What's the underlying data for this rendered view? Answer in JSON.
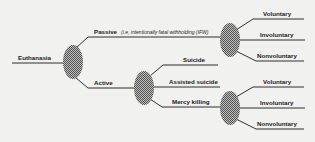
{
  "diagram": {
    "type": "tree",
    "root": {
      "label": "Euthanasia"
    },
    "branches": {
      "passive": {
        "label": "Passive",
        "note": "(i.e, intentionally fatal withholding (IFW)",
        "children": [
          "Voluntary",
          "Involuntary",
          "Nonvoluntary"
        ]
      },
      "active": {
        "label": "Active",
        "children": [
          "Suicide",
          "Assisted suicide",
          "Mercy killing"
        ]
      },
      "mercy_killing": {
        "label": "Mercy killing",
        "children": [
          "Voluntary",
          "Involuntary",
          "Nonvoluntary"
        ]
      }
    },
    "colors": {
      "line": "#1a1a1a",
      "node_fill": "#8a8a8a",
      "background": "#f1f1f0"
    }
  }
}
